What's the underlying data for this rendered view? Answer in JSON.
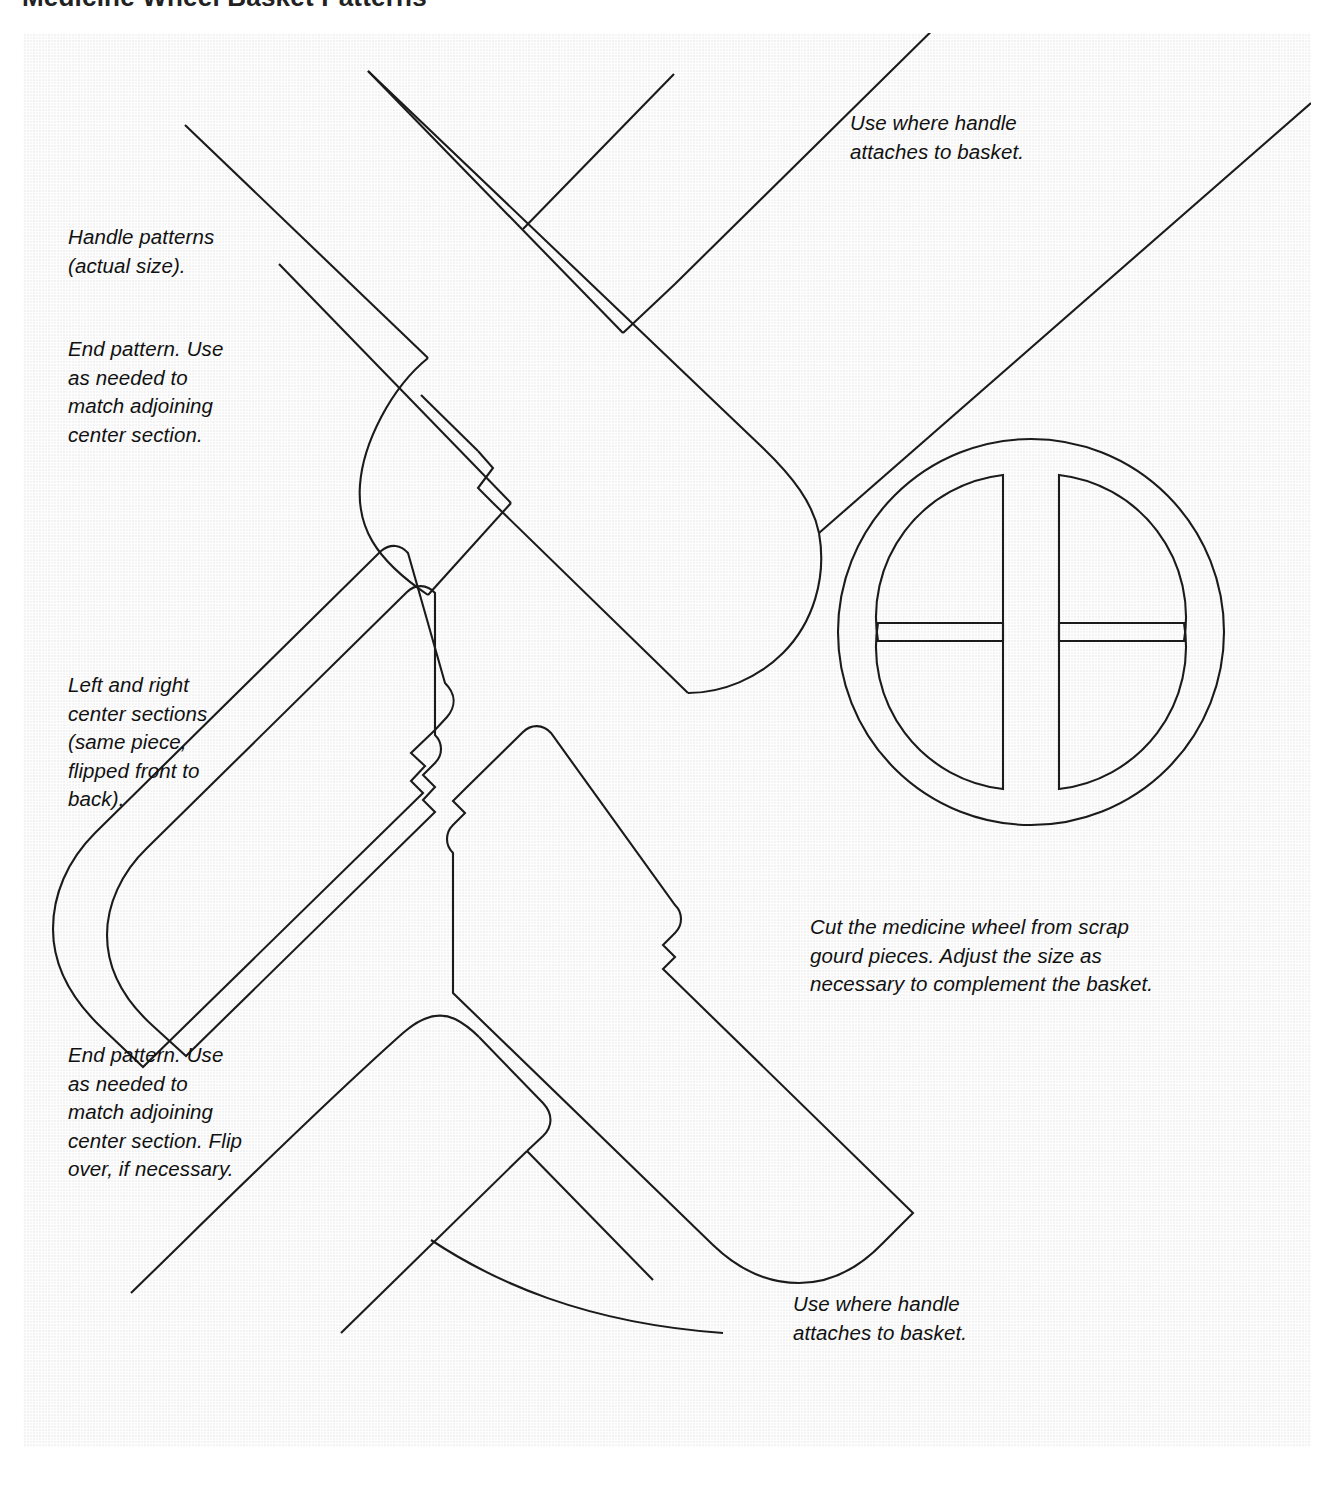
{
  "document": {
    "title": "Medicine Wheel Basket Patterns"
  },
  "captions": {
    "handle_patterns": "Handle patterns\n(actual size).",
    "end_pattern_top": "End pattern. Use\nas needed to\nmatch adjoining\ncenter section.",
    "center_sections": "Left and right\ncenter sections\n(same piece,\nflipped front to\nback).",
    "end_pattern_bottom": "End pattern. Use\nas needed to\nmatch adjoining\ncenter section. Flip\nover, if necessary.",
    "handle_attach_top": "Use where handle\nattaches to basket.",
    "handle_attach_bottom": "Use where handle\nattaches to basket.",
    "medicine_wheel_note": "Cut the medicine wheel from scrap\ngourd pieces. Adjust the size as\nnecessary to complement the basket."
  },
  "figure": {
    "kind": "pattern-template-sheet",
    "pieces": [
      {
        "name": "top-end-pattern-left",
        "label": "End pattern (top left)"
      },
      {
        "name": "top-end-pattern-right",
        "label": "Handle attach pattern (top right)"
      },
      {
        "name": "center-section-left",
        "label": "Left center section"
      },
      {
        "name": "center-section-right",
        "label": "Right center section"
      },
      {
        "name": "bottom-end-pattern",
        "label": "End pattern (bottom)"
      },
      {
        "name": "medicine-wheel",
        "label": "Medicine wheel disc"
      }
    ],
    "medicine_wheel": {
      "outer_circle": {
        "cx": 1008,
        "cy": 599,
        "r": 193
      },
      "quadrants": 4,
      "quadrant_radius": 143,
      "gap_half_width": 14
    },
    "colors": {
      "ink": "#1b1b1b",
      "paper": "#f6f6f6",
      "page": "#ffffff",
      "title": "#222222"
    }
  }
}
